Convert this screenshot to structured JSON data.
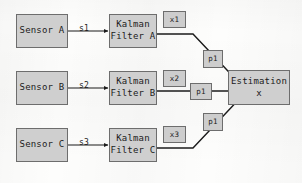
{
  "diagram": {
    "colors": {
      "node_fill": "#cfcfcf",
      "node_border": "#6d6d6d",
      "wire": "#1b1b1b",
      "background": "#fdfdfc"
    },
    "sensors": [
      {
        "id": "sensor-a",
        "label": "Sensor A"
      },
      {
        "id": "sensor-b",
        "label": "Sensor B"
      },
      {
        "id": "sensor-c",
        "label": "Sensor C"
      }
    ],
    "filters": [
      {
        "id": "kalman-filter-a",
        "line1": "Kalman",
        "line2": "Filter A"
      },
      {
        "id": "kalman-filter-b",
        "line1": "Kalman",
        "line2": "Filter B"
      },
      {
        "id": "kalman-filter-c",
        "line1": "Kalman",
        "line2": "Filter C"
      }
    ],
    "signal_labels": [
      {
        "id": "signal-s1",
        "label": "s1"
      },
      {
        "id": "signal-s2",
        "label": "s2"
      },
      {
        "id": "signal-s3",
        "label": "s3"
      }
    ],
    "state_tags": [
      {
        "id": "state-x1",
        "label": "x1"
      },
      {
        "id": "state-x2",
        "label": "x2"
      },
      {
        "id": "state-x3",
        "label": "x3"
      }
    ],
    "covariance_tags": [
      {
        "id": "covariance-p1-top",
        "label": "p1"
      },
      {
        "id": "covariance-p1-middle",
        "label": "p1"
      },
      {
        "id": "covariance-p1-bottom",
        "label": "p1"
      }
    ],
    "output": {
      "id": "estimation-block",
      "line1": "Estimation",
      "line2": "x"
    }
  }
}
